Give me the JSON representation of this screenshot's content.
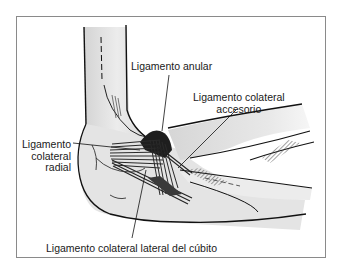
{
  "diagram": {
    "labels": {
      "annular": "Ligamento anular",
      "accessory_line1": "Ligamento colateral",
      "accessory_line2": "accesorio",
      "radial_line1": "Ligamento",
      "radial_line2": "colateral",
      "radial_line3": "radial",
      "lateral_ulnar": "Ligamento colateral lateral del cúbito"
    },
    "colors": {
      "frame": "#8a8a8a",
      "bone_fill": "#e2e2e2",
      "ligament": "#2a2a2a",
      "text": "#1a1a1a"
    }
  }
}
